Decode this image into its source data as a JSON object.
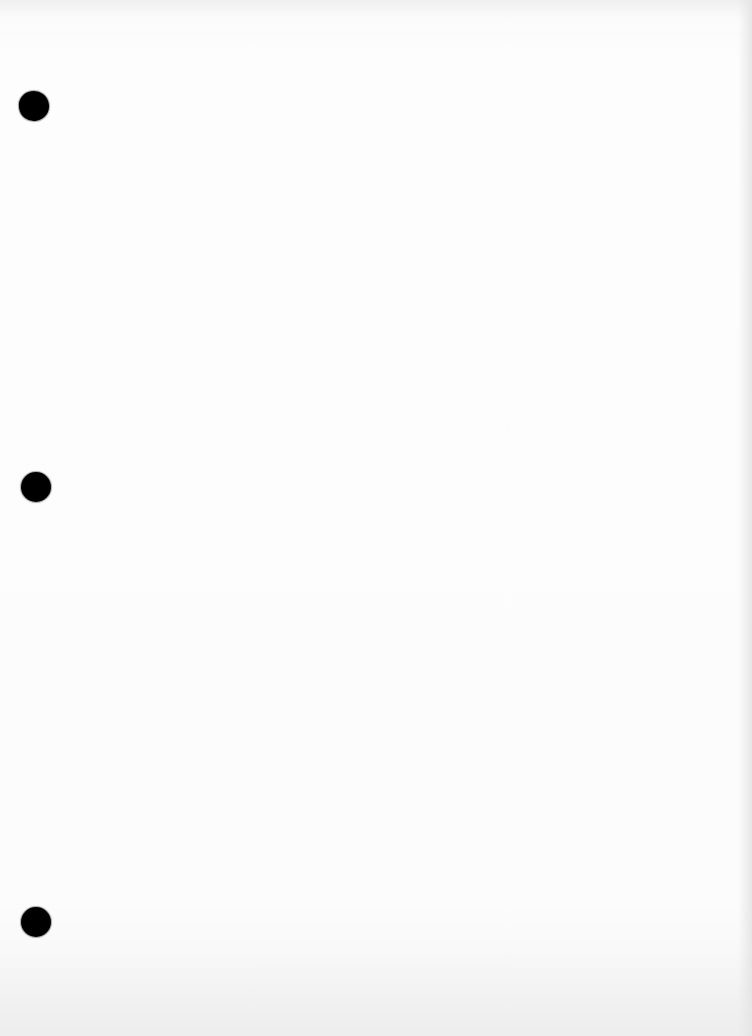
{
  "document": {
    "type": "blank-scanned-page",
    "content_text": "",
    "background_color": "#fcfcfc",
    "punch_holes": [
      {
        "position": "top",
        "color": "#000000"
      },
      {
        "position": "middle",
        "color": "#000000"
      },
      {
        "position": "bottom",
        "color": "#000000"
      }
    ]
  }
}
